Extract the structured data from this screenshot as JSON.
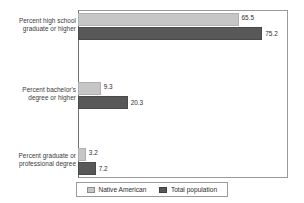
{
  "chart_data": {
    "type": "bar",
    "orientation": "horizontal",
    "title": "",
    "xlabel": "",
    "ylabel": "",
    "categories": [
      "Percent high school graduate or higher",
      "Percent bachelor's degree or higher",
      "Percent graduate or professional degree"
    ],
    "category_lines": [
      [
        "Percent high school",
        "graduate or higher"
      ],
      [
        "Percent bachelor's",
        "degree or higher"
      ],
      [
        "Percent graduate or",
        "professional degree"
      ]
    ],
    "series": [
      {
        "name": "Native American",
        "color": "#c6c6c6",
        "values": [
          65.5,
          9.3,
          3.2
        ],
        "labels": [
          "65.5",
          "9.3",
          "3.2"
        ]
      },
      {
        "name": "Total population",
        "color": "#585858",
        "values": [
          75.2,
          20.3,
          7.2
        ],
        "labels": [
          "75.2",
          "20.3",
          "7.2"
        ]
      }
    ],
    "xlim": [
      0,
      85.7
    ],
    "grid": false,
    "legend_position": "bottom",
    "data_labels": true
  },
  "legend": {
    "items": [
      {
        "label": "Native American",
        "swatch": "legend-swatch-native-american"
      },
      {
        "label": "Total population",
        "swatch": "legend-swatch-total-population"
      }
    ]
  }
}
